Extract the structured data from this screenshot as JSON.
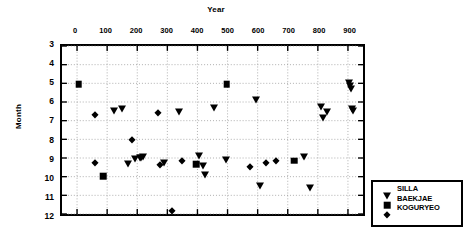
{
  "chart_data": {
    "type": "scatter",
    "title": "Year",
    "xlabel": "Year",
    "ylabel": "Month",
    "xlim": [
      -50,
      950
    ],
    "ylim": [
      3,
      12
    ],
    "y_inverted": true,
    "grid": true,
    "legend_position": "right-outside-bottom",
    "x_ticks": [
      "0",
      "100",
      "200",
      "300",
      "400",
      "500",
      "600",
      "700",
      "800",
      "900"
    ],
    "x_tick_values": [
      0,
      100,
      200,
      300,
      400,
      500,
      600,
      700,
      800,
      900
    ],
    "y_ticks": [
      "3",
      "4",
      "5",
      "6",
      "7",
      "8",
      "9",
      "10",
      "11",
      "12"
    ],
    "y_tick_values": [
      3,
      4,
      5,
      6,
      7,
      8,
      9,
      10,
      11,
      12
    ],
    "series": [
      {
        "name": "SILLA",
        "marker": "triangle-down",
        "color": "#000000",
        "points": [
          [
            120,
            6.4
          ],
          [
            148,
            6.3
          ],
          [
            167,
            9.2
          ],
          [
            190,
            8.9
          ],
          [
            205,
            8.85
          ],
          [
            210,
            8.85
          ],
          [
            216,
            8.8
          ],
          [
            285,
            9.1
          ],
          [
            335,
            6.45
          ],
          [
            400,
            8.75
          ],
          [
            411,
            9.3
          ],
          [
            418,
            9.75
          ],
          [
            448,
            6.25
          ],
          [
            487,
            8.95
          ],
          [
            585,
            5.85
          ],
          [
            600,
            10.3
          ],
          [
            745,
            8.8
          ],
          [
            762,
            10.45
          ],
          [
            800,
            6.2
          ],
          [
            805,
            6.75
          ],
          [
            818,
            6.45
          ],
          [
            890,
            4.95
          ],
          [
            893,
            5.1
          ],
          [
            896,
            5.25
          ],
          [
            900,
            6.3
          ],
          [
            903,
            6.4
          ]
        ]
      },
      {
        "name": "BAEKJAE",
        "marker": "square",
        "color": "#000000",
        "points": [
          [
            5,
            5.0
          ],
          [
            85,
            9.8
          ],
          [
            390,
            9.2
          ],
          [
            490,
            5.0
          ],
          [
            712,
            9.0
          ]
        ]
      },
      {
        "name": "KOGURYEO",
        "marker": "diamond",
        "color": "#000000",
        "points": [
          [
            58,
            6.6
          ],
          [
            58,
            9.1
          ],
          [
            178,
            7.9
          ],
          [
            265,
            6.5
          ],
          [
            272,
            9.25
          ],
          [
            310,
            11.65
          ],
          [
            345,
            9.0
          ],
          [
            565,
            9.35
          ],
          [
            620,
            9.1
          ],
          [
            650,
            9.0
          ]
        ]
      }
    ]
  },
  "legend": {
    "entries": [
      {
        "label": "SILLA",
        "marker": "triangle-down"
      },
      {
        "label": "BAEKJAE",
        "marker": "square"
      },
      {
        "label": "KOGURYEO",
        "marker": "diamond"
      }
    ]
  }
}
